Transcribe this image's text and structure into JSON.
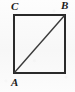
{
  "figure": {
    "type": "geometry-diagram",
    "shape": "square",
    "background_color": "#fbfbfb",
    "stroke_color": "#2a2a2a",
    "diagonal_color": "#3a3a3a",
    "square": {
      "left": 13,
      "top": 14,
      "right": 66,
      "bottom": 74,
      "border_width": 2
    },
    "diagonal": {
      "from": "A",
      "to": "B",
      "x1": 14,
      "y1": 73,
      "x2": 65,
      "y2": 15,
      "width": 1.3
    },
    "vertices": [
      {
        "id": "C",
        "label": "C",
        "position": "top-left",
        "x": 13,
        "y": 14
      },
      {
        "id": "B",
        "label": "B",
        "position": "top-right",
        "x": 66,
        "y": 14
      },
      {
        "id": "A",
        "label": "A",
        "position": "bottom-left",
        "x": 13,
        "y": 74
      }
    ]
  }
}
